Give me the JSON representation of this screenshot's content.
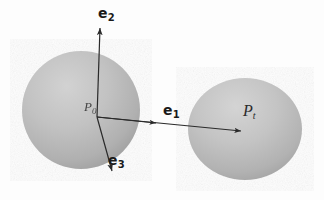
{
  "figure": {
    "background_color": "#fdfdfd",
    "sphere_fill_light": "#c9c9c9",
    "sphere_fill_dark": "#a2a2a2",
    "line_color": "#2a2a2a",
    "label_color": "#1a1a1a"
  },
  "labels": {
    "e1": {
      "base": "e",
      "sub": "1"
    },
    "e2": {
      "base": "e",
      "sub": "2"
    },
    "e3": {
      "base": "e",
      "sub": "3"
    },
    "pt": {
      "base": "P",
      "sub": "t"
    },
    "origin": {
      "base": "P",
      "sub": "0"
    }
  },
  "shapes": {
    "left_sphere": {
      "cx": 81,
      "cy": 110,
      "r": 59
    },
    "right_sphere": {
      "cx": 245,
      "cy": 129,
      "rx": 57,
      "ry": 51
    }
  },
  "vectors": {
    "e1": {
      "from_x": 97,
      "from_y": 117,
      "to_x": 241,
      "to_y": 131,
      "mid_arrow_x": 155,
      "mid_arrow_y": 122
    },
    "e2": {
      "from_x": 97,
      "from_y": 117,
      "to_x": 100,
      "to_y": 27
    },
    "e3": {
      "from_x": 97,
      "from_y": 117,
      "to_x": 112,
      "to_y": 172
    }
  }
}
